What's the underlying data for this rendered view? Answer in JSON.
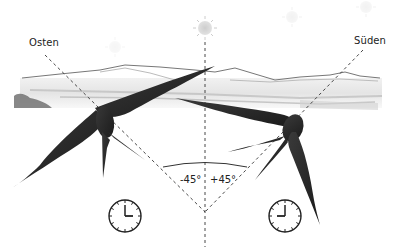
{
  "directions": {
    "east_label": "Osten",
    "south_label": "Süden"
  },
  "angles": {
    "minus": "-45°",
    "plus": "+45°"
  },
  "clocks": [
    {
      "name": "clock-left",
      "time": "3:00",
      "hour": 3,
      "minute": 0
    },
    {
      "name": "clock-right",
      "time": "9:00",
      "hour": 9,
      "minute": 0
    }
  ],
  "suns": [
    {
      "x": 115,
      "y": 47,
      "opacity": 0.15
    },
    {
      "x": 205,
      "y": 28,
      "opacity": 0.6
    },
    {
      "x": 292,
      "y": 17,
      "opacity": 0.2
    },
    {
      "x": 366,
      "y": 7,
      "opacity": 0.2
    }
  ],
  "colors": {
    "ink": "#222222",
    "bird": "#2a2a2a",
    "landscape": "#8a8a8a",
    "sun": "#c8c8c8"
  }
}
